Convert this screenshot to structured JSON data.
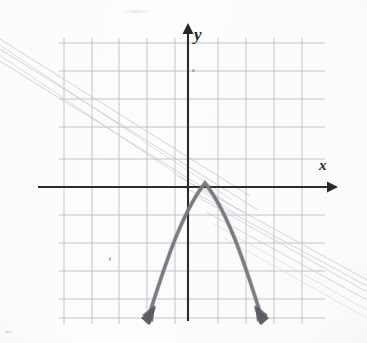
{
  "figure": {
    "kind": "hand-drawn-coordinate-graph",
    "medium": "pencil on graph paper (scanned)",
    "axis_labels": {
      "x": "x",
      "y": "y"
    },
    "background_color": "#fdfdfc",
    "grid_color": "#b9bcc4",
    "axis_color": "#2b2b30",
    "curve_color": "#6a6a72",
    "bleed_color": "#c9ccd4"
  },
  "chart_data": {
    "type": "line",
    "title": "",
    "subtitle": "",
    "xlabel": "x",
    "ylabel": "y",
    "grid": true,
    "legend": "none",
    "axis_ticks_labeled": false,
    "xlim": [
      -4.5,
      4.2
    ],
    "ylim": [
      -4.8,
      5.2
    ],
    "x_axis_pixel_y": 187,
    "y_axis_pixel_x": 188,
    "grid_cell_px": 27.7,
    "grid_vertical_lines_px": [
      64,
      92,
      119,
      147,
      175,
      188,
      218,
      246,
      274,
      302
    ],
    "grid_horizontal_lines_px": [
      43,
      71,
      99,
      127,
      159,
      187,
      215,
      243,
      271,
      299,
      318
    ],
    "series": [
      {
        "name": "parabola",
        "shape": "downward-opening parabola",
        "vertex": [
          0.6,
          0.15
        ],
        "vertex_pixel": [
          205,
          183
        ],
        "direction": "opens downward",
        "arrowheads": [
          "left-end",
          "right-end"
        ],
        "arrowhead_pixels": [
          [
            148,
            322
          ],
          [
            262,
            322
          ]
        ],
        "x_intercepts_approx": [
          -0.8,
          2.0
        ],
        "x": [
          -2.05,
          -1.6,
          -1.2,
          -0.8,
          -0.4,
          0.0,
          0.3,
          0.6,
          0.9,
          1.2,
          1.6,
          2.0,
          2.4,
          2.75
        ],
        "y": [
          -4.85,
          -3.2,
          -1.9,
          -0.85,
          -0.1,
          0.0,
          0.1,
          0.15,
          0.05,
          -0.3,
          -1.3,
          -2.55,
          -4.0,
          -4.85
        ]
      },
      {
        "name": "bleed-through-lines-upper-left",
        "shape": "faint straight diagonal lines from reverse page",
        "count": 3,
        "slope_approx": -0.62
      },
      {
        "name": "bleed-through-lines-lower-right",
        "shape": "faint straight diagonal lines from reverse page",
        "count": 4,
        "slope_approx": -0.55
      }
    ],
    "annotations": [
      {
        "name": "stray-pencil-dot",
        "pixel": [
          193,
          70
        ]
      },
      {
        "name": "stray-pencil-dot",
        "pixel": [
          110,
          258
        ]
      }
    ]
  }
}
